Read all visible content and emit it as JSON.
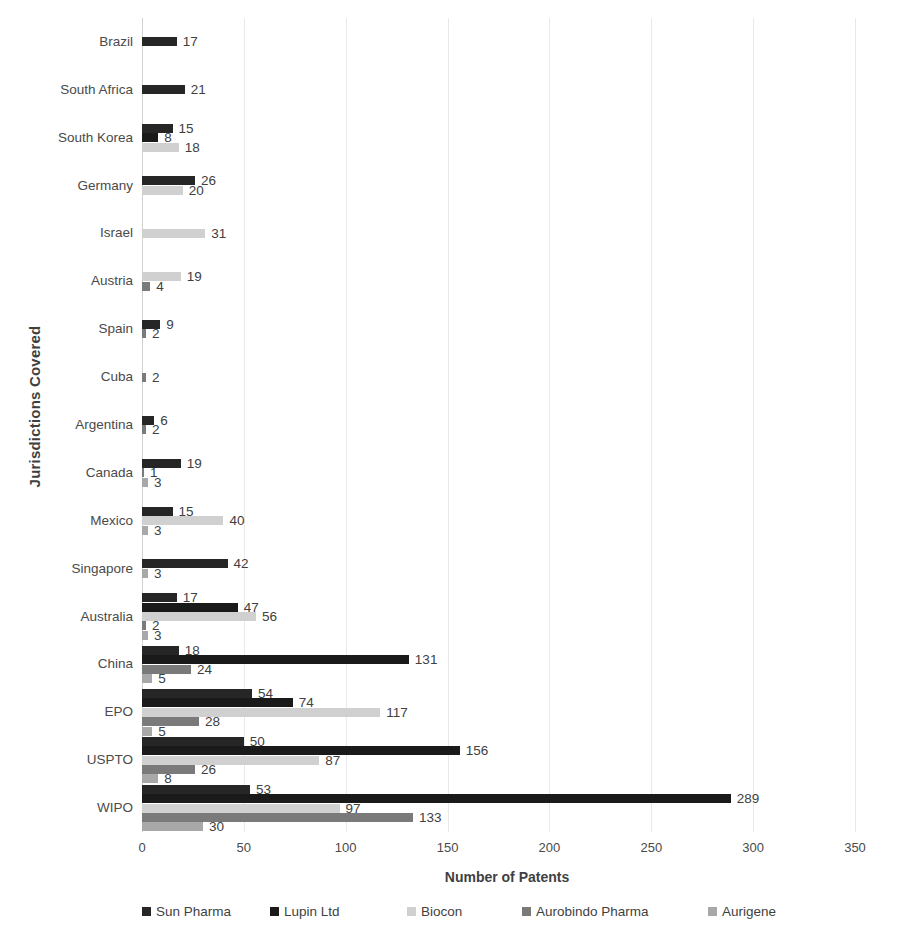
{
  "chart_data": {
    "type": "bar",
    "orientation": "horizontal",
    "title": "",
    "xlabel": "Number of Patents",
    "ylabel": "Jurisdictions Covered",
    "xlim": [
      0,
      350
    ],
    "xticks": [
      0,
      50,
      100,
      150,
      200,
      250,
      300,
      350
    ],
    "grid": true,
    "legend_position": "bottom",
    "categories": [
      "Brazil",
      "South Africa",
      "South Korea",
      "Germany",
      "Israel",
      "Austria",
      "Spain",
      "Cuba",
      "Argentina",
      "Canada",
      "Mexico",
      "Singapore",
      "Australia",
      "China",
      "EPO",
      "USPTO",
      "WIPO"
    ],
    "series": [
      {
        "name": "Sun Pharma",
        "color": "#262626",
        "values": [
          17,
          21,
          15,
          26,
          null,
          null,
          9,
          null,
          6,
          19,
          15,
          42,
          17,
          18,
          54,
          50,
          53
        ]
      },
      {
        "name": "Lupin Ltd",
        "color": "#1a1a1a",
        "values": [
          null,
          null,
          8,
          null,
          null,
          null,
          null,
          null,
          null,
          null,
          null,
          null,
          47,
          131,
          74,
          156,
          289
        ]
      },
      {
        "name": "Biocon",
        "color": "#d0d0d0",
        "values": [
          null,
          null,
          18,
          20,
          31,
          19,
          null,
          null,
          null,
          null,
          40,
          null,
          56,
          null,
          117,
          87,
          97
        ]
      },
      {
        "name": "Aurobindo Pharma",
        "color": "#7a7a7a",
        "values": [
          null,
          null,
          null,
          null,
          null,
          4,
          2,
          2,
          2,
          1,
          null,
          null,
          2,
          24,
          28,
          26,
          133
        ]
      },
      {
        "name": "Aurigene",
        "color": "#a8a8a8",
        "values": [
          null,
          null,
          null,
          null,
          null,
          null,
          null,
          null,
          null,
          3,
          3,
          3,
          3,
          5,
          5,
          8,
          30
        ]
      }
    ]
  },
  "legend": {
    "items": [
      {
        "label": "Sun Pharma",
        "color": "#262626"
      },
      {
        "label": "Lupin Ltd",
        "color": "#1a1a1a"
      },
      {
        "label": "Biocon",
        "color": "#d0d0d0"
      },
      {
        "label": "Aurobindo Pharma",
        "color": "#7a7a7a"
      },
      {
        "label": "Aurigene",
        "color": "#a8a8a8"
      }
    ]
  }
}
